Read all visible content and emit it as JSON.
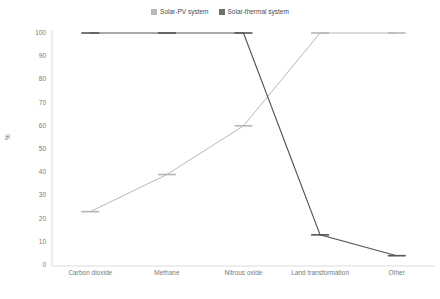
{
  "chart_data": {
    "type": "line",
    "title": "",
    "xlabel": "",
    "ylabel": "%",
    "ylim": [
      0,
      100
    ],
    "yticks": [
      0,
      10,
      20,
      30,
      40,
      50,
      60,
      70,
      80,
      90,
      100
    ],
    "grid": false,
    "legend_position": "top-center",
    "categories": [
      "Carbon dioxide",
      "Methane",
      "Nitrous oxide",
      "Land transformation",
      "Other"
    ],
    "series": [
      {
        "name": "Solar-PV system",
        "color": "#b7b7b7",
        "values": [
          23,
          39,
          60,
          100,
          100
        ]
      },
      {
        "name": "Solar-thermal system",
        "color": "#555555",
        "values": [
          100,
          100,
          100,
          13,
          4
        ]
      }
    ]
  },
  "legend": {
    "entries": [
      {
        "label": "Solar-PV system",
        "color": "#b7b7b7"
      },
      {
        "label": "Solar-thermal system",
        "color": "#6e6e6e"
      }
    ]
  },
  "axes": {
    "y_title": "%",
    "y_tick_labels": [
      "100",
      "90",
      "80",
      "70",
      "60",
      "50",
      "40",
      "30",
      "20",
      "10",
      "0"
    ],
    "x_tick_labels": [
      "Carbon dioxide",
      "Methane",
      "Nitrous oxide",
      "Land transformation",
      "Other"
    ]
  },
  "colors": {
    "series_light": "#b7b7b7",
    "series_dark": "#555555",
    "axis": "#d9d9d9",
    "text": "#7a7a7a",
    "background": "#ffffff"
  }
}
